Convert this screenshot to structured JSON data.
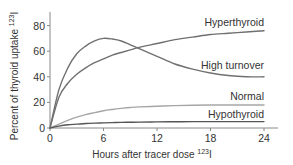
{
  "chart_data": {
    "type": "line",
    "title": "",
    "xlabel": "Hours after tracer dose",
    "xlabel_superscript": "123",
    "xlabel_suffix": "I",
    "ylabel": "Percent of thyroid uptake",
    "ylabel_superscript": "123",
    "ylabel_suffix": "I",
    "xlim": [
      0,
      24
    ],
    "ylim": [
      0,
      90
    ],
    "xticks": [
      0,
      6,
      12,
      18,
      24
    ],
    "yticks": [
      0,
      20,
      40,
      60,
      80
    ],
    "grid": false,
    "legend": "inline labels at right end of each curve",
    "x": [
      0,
      1,
      2,
      3,
      4,
      5,
      6,
      7,
      8,
      9,
      10,
      12,
      14,
      16,
      18,
      20,
      22,
      24
    ],
    "series": [
      {
        "name": "Hyperthyroid",
        "color": "#707070",
        "values": [
          0,
          24,
          35,
          42,
          47,
          51,
          54,
          57,
          59,
          61,
          63,
          66,
          69,
          71,
          73,
          74,
          75,
          76
        ]
      },
      {
        "name": "High turnover",
        "color": "#707070",
        "values": [
          0,
          30,
          47,
          58,
          64,
          68,
          70,
          69.5,
          68,
          65,
          62,
          56,
          50,
          46,
          43,
          41,
          40,
          40
        ]
      },
      {
        "name": "Normal",
        "color": "#a6a6a6",
        "values": [
          0,
          3,
          6,
          8.5,
          10.5,
          12,
          13.5,
          14.5,
          15.3,
          16,
          16.5,
          17,
          17.5,
          17.8,
          18,
          18,
          18,
          18
        ]
      },
      {
        "name": "Hypothyroid",
        "color": "#555555",
        "values": [
          0,
          1.5,
          2.5,
          3,
          3.5,
          3.8,
          4,
          4.2,
          4.4,
          4.5,
          4.6,
          4.8,
          4.9,
          5,
          5,
          5,
          5,
          5
        ]
      }
    ]
  },
  "labels": {
    "ylabel": "Percent of thyroid uptake",
    "ylabel_sup": "123",
    "ylabel_tail": "I",
    "xlabel": "Hours after tracer dose",
    "xlabel_sup": "123",
    "xlabel_tail": "I",
    "series": [
      "Hyperthyroid",
      "High turnover",
      "Normal",
      "Hypothyroid"
    ],
    "xticks": [
      "0",
      "6",
      "12",
      "18",
      "24"
    ],
    "yticks": [
      "0",
      "20",
      "40",
      "60",
      "80"
    ]
  }
}
